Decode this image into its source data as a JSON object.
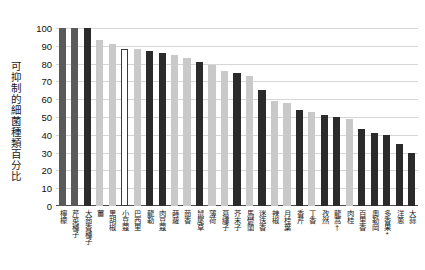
{
  "chart_data": {
    "type": "bar",
    "title": "",
    "xlabel": "",
    "ylabel": "可抑制的細菌種類百分比",
    "ylim": [
      0,
      100
    ],
    "yticks": [
      0,
      10,
      20,
      30,
      40,
      50,
      60,
      70,
      80,
      90,
      100
    ],
    "ytick_labels": [
      "0",
      "10",
      "20",
      "30",
      "40",
      "50",
      "60",
      "70",
      "80",
      "90",
      "100"
    ],
    "grid": true,
    "legend": "none",
    "categories": [
      "檸檬",
      "芹菜種子",
      "大茴香種子",
      "薑",
      "黑胡椒",
      "小豆蔻",
      "巴西里",
      "龍勒",
      "肉豆蔻",
      "蒔蘿",
      "茴香",
      "鼠尾草",
      "薄荷",
      "葛縷子",
      "芥末子",
      "馬鬱蘭",
      "迷迭香",
      "辣椒",
      "月桂葉",
      "香芹",
      "丁香",
      "孜然",
      "龍蒿†",
      "肉桂",
      "百里香",
      "奧勒岡",
      "多香果*",
      "洋蔥",
      "大蒜"
    ],
    "values": [
      100,
      100,
      100,
      93,
      91,
      88,
      88,
      87,
      86,
      85,
      83,
      81,
      79,
      76,
      75,
      73,
      65,
      59,
      58,
      54,
      53,
      51,
      50,
      49,
      43,
      41,
      40,
      35,
      30
    ],
    "bar_styles": [
      "medium",
      "medium",
      "dark",
      "light",
      "light",
      "outline",
      "light",
      "dark",
      "dark",
      "light",
      "light",
      "dark",
      "light",
      "light",
      "dark",
      "light",
      "dark",
      "light",
      "light",
      "dark",
      "light",
      "dark",
      "dark",
      "light",
      "dark",
      "dark",
      "dark",
      "dark",
      "dark"
    ]
  },
  "colors": {
    "dark": "#2b2b2b",
    "medium": "#5a5a5a",
    "light": "#c9c9c9",
    "outline_fill": "#ffffff",
    "outline_stroke": "#3a3a3a",
    "gridline": "#d6d6d6",
    "axis": "#4d4d4d",
    "text": "#1a1a1a",
    "background": "#ffffff"
  }
}
